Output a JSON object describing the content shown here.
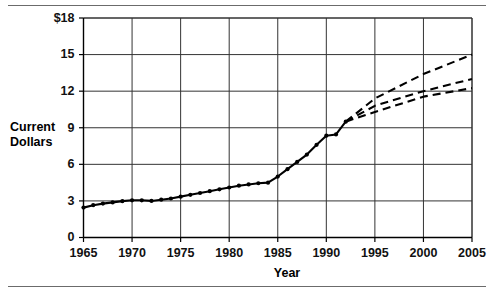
{
  "figure": {
    "rules": {
      "top": "horizontal-rule",
      "bottom": "horizontal-rule"
    }
  },
  "chart_data": {
    "type": "line",
    "title": "",
    "subtitle": "",
    "xlabel": "Year",
    "ylabel": "Current Dollars",
    "ylabel_line1": "Current",
    "ylabel_line2": "Dollars",
    "xlim": [
      1965,
      2005
    ],
    "ylim": [
      0,
      18
    ],
    "xticks": [
      1965,
      1970,
      1975,
      1980,
      1985,
      1990,
      1995,
      2000,
      2005
    ],
    "xtick_labels": [
      "1965",
      "1970",
      "1975",
      "1980",
      "1985",
      "1990",
      "1995",
      "2000",
      "2005"
    ],
    "yticks": [
      0,
      3,
      6,
      9,
      12,
      15,
      18
    ],
    "ytick_labels": [
      "0",
      "3",
      "6",
      "9",
      "12",
      "15",
      "$18"
    ],
    "grid": "both",
    "legend": "none",
    "series": [
      {
        "name": "Historical",
        "style": "solid-with-markers",
        "color": "#000000",
        "x": [
          1965,
          1966,
          1967,
          1968,
          1969,
          1970,
          1971,
          1972,
          1973,
          1974,
          1975,
          1976,
          1977,
          1978,
          1979,
          1980,
          1981,
          1982,
          1983,
          1984,
          1985,
          1986,
          1987,
          1988,
          1989,
          1990,
          1991,
          1992
        ],
        "values": [
          2.45,
          2.65,
          2.78,
          2.88,
          2.98,
          3.05,
          3.05,
          3.0,
          3.1,
          3.2,
          3.35,
          3.5,
          3.65,
          3.8,
          3.95,
          4.1,
          4.25,
          4.35,
          4.45,
          4.5,
          5.0,
          5.6,
          6.2,
          6.8,
          7.6,
          8.35,
          8.45,
          9.5
        ]
      },
      {
        "name": "Projection high",
        "style": "dashed",
        "color": "#000000",
        "x": [
          1992,
          1995,
          2000,
          2005
        ],
        "values": [
          9.5,
          11.4,
          13.4,
          15.0
        ]
      },
      {
        "name": "Projection middle",
        "style": "dashed",
        "color": "#000000",
        "x": [
          1992,
          1995,
          2000,
          2005
        ],
        "values": [
          9.5,
          10.8,
          12.0,
          13.0
        ]
      },
      {
        "name": "Projection low",
        "style": "dashed",
        "color": "#000000",
        "x": [
          1992,
          1995,
          2000,
          2005
        ],
        "values": [
          9.5,
          10.3,
          11.55,
          12.25
        ]
      }
    ]
  }
}
